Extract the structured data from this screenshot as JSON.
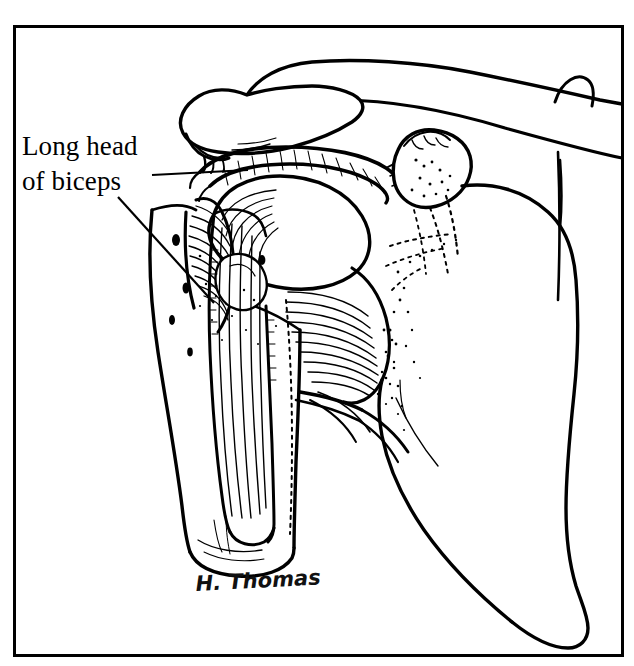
{
  "figure": {
    "kind": "anatomical-line-illustration",
    "background_color": "#ffffff",
    "ink_color": "#000000",
    "frame": {
      "name": "border-frame",
      "x": 14,
      "y": 26,
      "width": 609,
      "height": 630,
      "stroke_width": 3,
      "color": "#000000"
    },
    "labels": [
      {
        "id": "long-head-of-biceps",
        "line1": "Long head",
        "line2": "of biceps",
        "x": 22,
        "y1": 152,
        "y2": 187,
        "font_size": 27,
        "color": "#000000"
      }
    ],
    "leader_lines": [
      {
        "id": "leader-horizontal",
        "from_x": 152,
        "from_y": 175,
        "to_x": 246,
        "to_y": 170,
        "stroke_width": 2
      },
      {
        "id": "leader-diagonal",
        "from_x": 118,
        "from_y": 196,
        "to_x": 212,
        "to_y": 300,
        "stroke_width": 2
      }
    ],
    "signature": {
      "id": "artist-signature",
      "text": "H. Thomas",
      "x": 196,
      "y": 590,
      "font_size": 21,
      "color": "#111111"
    },
    "structures": [
      {
        "id": "clavicle",
        "label": "Clavicle"
      },
      {
        "id": "acromion",
        "label": "Acromion"
      },
      {
        "id": "coracoid-process",
        "label": "Coracoid process"
      },
      {
        "id": "coracoacromial-ligament",
        "label": "Coracoacromial ligament"
      },
      {
        "id": "humeral-head",
        "label": "Head of humerus"
      },
      {
        "id": "greater-tuberosity",
        "label": "Greater tuberosity"
      },
      {
        "id": "lesser-tuberosity",
        "label": "Lesser tuberosity"
      },
      {
        "id": "bicipital-groove",
        "label": "Intertubercular (bicipital) groove"
      },
      {
        "id": "biceps-long-head-tendon",
        "label": "Long head of biceps tendon"
      },
      {
        "id": "humeral-shaft",
        "label": "Shaft of humerus"
      },
      {
        "id": "scapula-body",
        "label": "Body of scapula"
      },
      {
        "id": "subscapularis-fibers",
        "label": "Subscapularis / capsule fibers"
      }
    ]
  }
}
